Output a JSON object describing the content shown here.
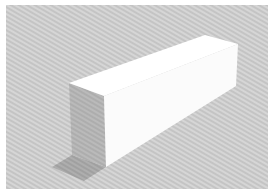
{
  "scene": {
    "subject": "3D rectangular prism (box) render",
    "colors": {
      "border": "#ffffff",
      "background_light": "#d4d4d4",
      "background_dark": "#c2c2c2",
      "top_face": "#ffffff",
      "side_face": "#fbfbfb",
      "front_face": "#b8b8b8",
      "ground_shadow": "#a9a9a9"
    },
    "geometry": {
      "top_face": [
        [
          69,
          83
        ],
        [
          205,
          35
        ],
        [
          238,
          44
        ],
        [
          104,
          96
        ]
      ],
      "side_face": [
        [
          104,
          96
        ],
        [
          238,
          44
        ],
        [
          236,
          86
        ],
        [
          106,
          167
        ]
      ],
      "front_face": [
        [
          69,
          83
        ],
        [
          104,
          96
        ],
        [
          106,
          167
        ],
        [
          72,
          155
        ]
      ],
      "ground_shadow": [
        [
          72,
          155
        ],
        [
          106,
          167
        ],
        [
          84,
          181
        ],
        [
          52,
          167
        ]
      ]
    }
  }
}
